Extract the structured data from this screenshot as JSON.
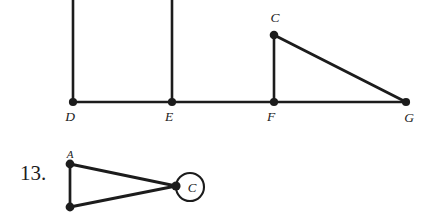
{
  "page": {
    "background_color": "#ffffff",
    "ink_color": "#1c1c1c",
    "width": 429,
    "height": 220
  },
  "figures": [
    {
      "id": "figure-top",
      "name": "baseline-graph-DEFG",
      "description": "Horizontal baseline through points D, E, F, G with vertical segments at D and E running off the top of the page, and a right triangle C-F-G",
      "vertices": [
        {
          "name": "D",
          "label": "D",
          "x": 73,
          "y": 102,
          "label_x": 70,
          "label_y": 121,
          "dot": true
        },
        {
          "name": "E",
          "label": "E",
          "x": 172,
          "y": 102,
          "label_x": 169,
          "label_y": 121,
          "dot": true
        },
        {
          "name": "F",
          "label": "F",
          "x": 274,
          "y": 102,
          "label_x": 271,
          "label_y": 121,
          "dot": true
        },
        {
          "name": "G",
          "label": "G",
          "x": 406,
          "y": 102,
          "label_x": 404,
          "label_y": 121,
          "dot": true
        },
        {
          "name": "C",
          "label": "C",
          "x": 274,
          "y": 35,
          "label_x": 272,
          "label_y": 22,
          "dot": true
        }
      ],
      "edges": [
        {
          "name": "baseline-D-G",
          "from": "D",
          "to": "G"
        },
        {
          "name": "vertical-D-up",
          "from": "D",
          "to": "top-edge"
        },
        {
          "name": "vertical-E-up",
          "from": "E",
          "to": "top-edge"
        },
        {
          "name": "segment-F-C",
          "from": "F",
          "to": "C"
        },
        {
          "name": "hypotenuse-C-G",
          "from": "C",
          "to": "G"
        }
      ]
    },
    {
      "id": "figure-13",
      "name": "triangle-with-loop-at-C",
      "number_label": "13.",
      "description": "Triangle with apex A at top-left, an unlabeled vertex at bottom-left, and vertex C at right carrying a self-loop circle",
      "vertices": [
        {
          "name": "A",
          "label": "A",
          "x": 70,
          "y": 164,
          "label_x": 68,
          "label_y": 158,
          "dot": true
        },
        {
          "name": "B",
          "label": "",
          "x": 70,
          "y": 207,
          "label_x": 0,
          "label_y": 0,
          "dot": true
        },
        {
          "name": "C",
          "label": "C",
          "x": 176,
          "y": 186,
          "label_x": 191,
          "label_y": 192,
          "dot": true
        }
      ],
      "edges": [
        {
          "name": "side-A-B",
          "from": "A",
          "to": "B"
        },
        {
          "name": "side-A-C",
          "from": "A",
          "to": "C"
        },
        {
          "name": "side-B-C",
          "from": "B",
          "to": "C"
        }
      ],
      "loop": {
        "name": "self-loop-circle-C",
        "cx": 190,
        "cy": 187,
        "r": 14
      }
    }
  ]
}
